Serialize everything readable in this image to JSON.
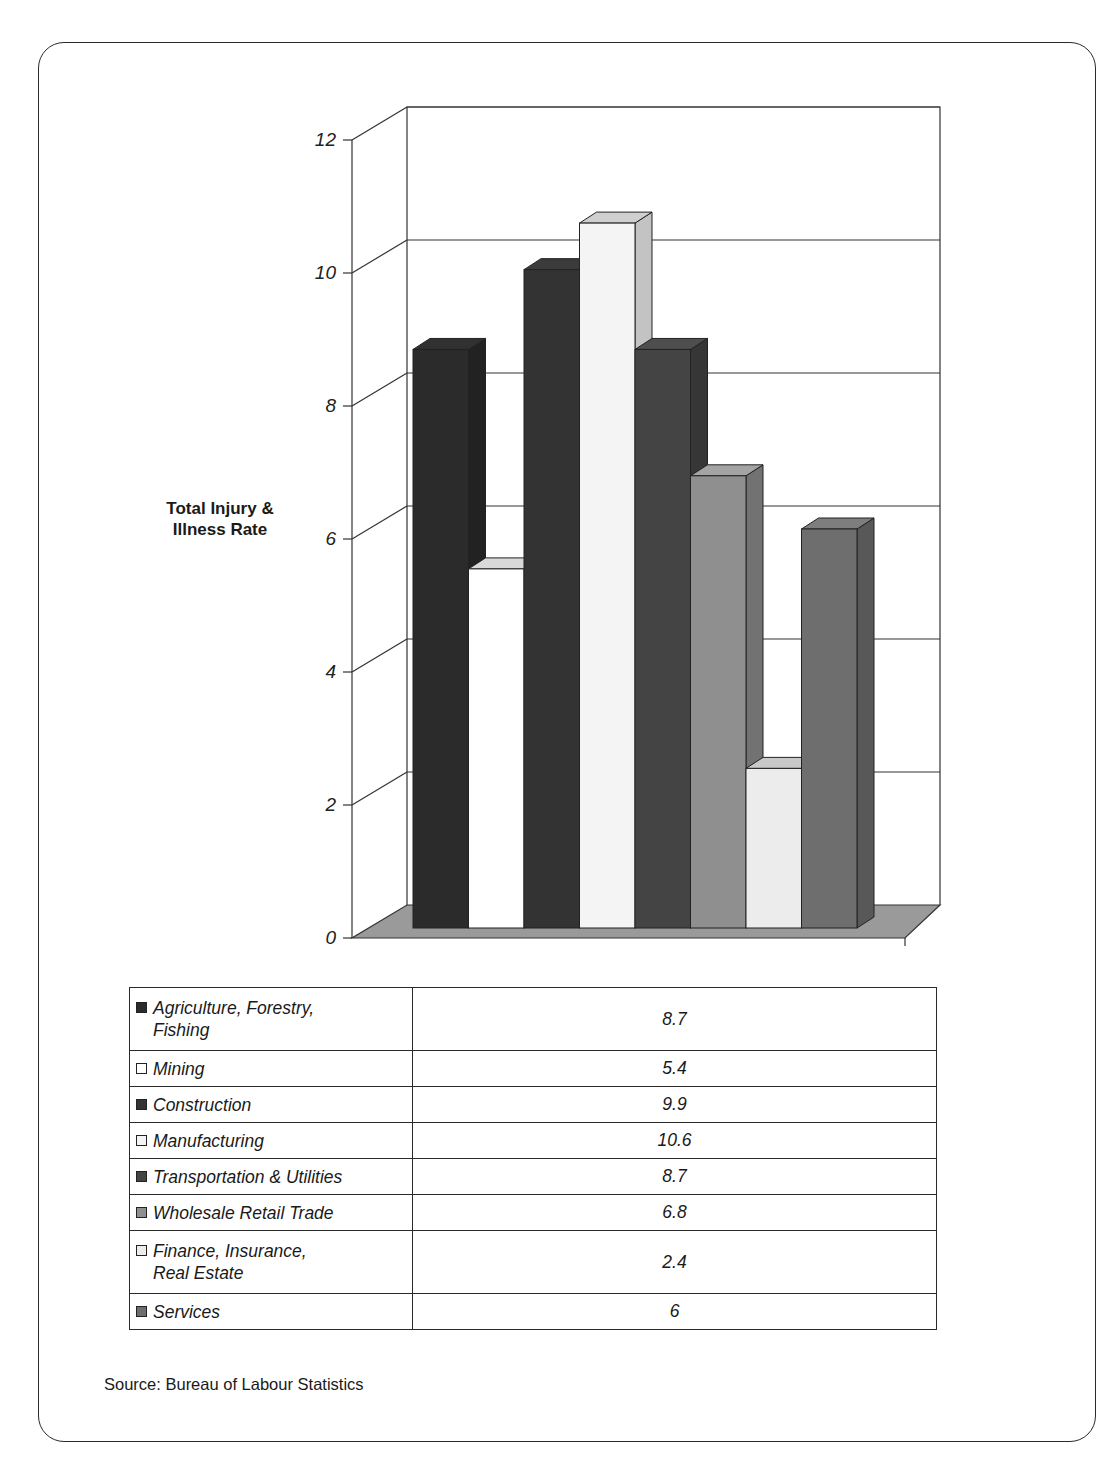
{
  "chart_data": {
    "type": "bar",
    "style": "3d-column",
    "title": "",
    "xlabel": "",
    "ylabel": "Total Injury & Illness Rate",
    "ylim": [
      0,
      12
    ],
    "yticks": [
      0,
      2,
      4,
      6,
      8,
      10,
      12
    ],
    "grid": true,
    "legend_position": "data-table-below",
    "categories": [
      "Agriculture, Forestry, Fishing",
      "Mining",
      "Construction",
      "Manufacturing",
      "Transportation & Utilities",
      "Wholesale Retail Trade",
      "Finance, Insurance, Real Estate",
      "Services"
    ],
    "values": [
      8.7,
      5.4,
      9.9,
      10.6,
      8.7,
      6.8,
      2.4,
      6
    ],
    "colors": [
      "#2b2b2b",
      "#ffffff",
      "#333333",
      "#f4f4f4",
      "#444444",
      "#8f8f8f",
      "#ececec",
      "#6e6e6e"
    ],
    "source": "Source: Bureau of Labour Statistics"
  },
  "labels": {
    "ylabel_line1": "Total Injury &",
    "ylabel_line2": "Illness Rate",
    "ticks": [
      "0",
      "2",
      "4",
      "6",
      "8",
      "10",
      "12"
    ]
  },
  "table": {
    "rows": [
      {
        "label_line1": "Agriculture, Forestry,",
        "label_line2": "Fishing",
        "value": "8.7",
        "swatch": "#2b2b2b"
      },
      {
        "label_line1": "Mining",
        "label_line2": "",
        "value": "5.4",
        "swatch": "#ffffff"
      },
      {
        "label_line1": "Construction",
        "label_line2": "",
        "value": "9.9",
        "swatch": "#333333"
      },
      {
        "label_line1": "Manufacturing",
        "label_line2": "",
        "value": "10.6",
        "swatch": "#f4f4f4"
      },
      {
        "label_line1": "Transportation & Utilities",
        "label_line2": "",
        "value": "8.7",
        "swatch": "#444444"
      },
      {
        "label_line1": "Wholesale Retail Trade",
        "label_line2": "",
        "value": "6.8",
        "swatch": "#8f8f8f"
      },
      {
        "label_line1": "Finance, Insurance,",
        "label_line2": "Real Estate",
        "value": "2.4",
        "swatch": "#ececec"
      },
      {
        "label_line1": "Services",
        "label_line2": "",
        "value": "6",
        "swatch": "#6e6e6e"
      }
    ]
  },
  "source": "Source: Bureau of Labour Statistics"
}
